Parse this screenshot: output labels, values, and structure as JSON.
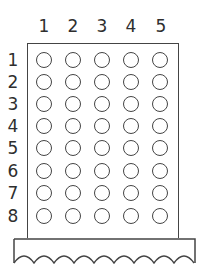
{
  "columns": [
    "1",
    "2",
    "3",
    "4",
    "5"
  ],
  "rows": [
    "1",
    "2",
    "3",
    "4",
    "5",
    "6",
    "7",
    "8"
  ],
  "colors": {
    "line": "#444444",
    "background": "#ffffff"
  }
}
